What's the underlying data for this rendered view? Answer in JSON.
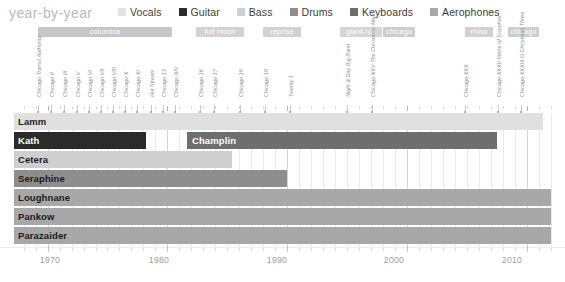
{
  "header": {
    "title": "year-by-year",
    "legend": [
      {
        "label": "Vocals",
        "color": "#e3e3e3",
        "key": "vocals"
      },
      {
        "label": "Guitar",
        "color": "#2b2b2b",
        "key": "guitar"
      },
      {
        "label": "Bass",
        "color": "#d0d0d0",
        "key": "bass"
      },
      {
        "label": "Drums",
        "color": "#8e8e8e",
        "key": "drums"
      },
      {
        "label": "Keyboards",
        "color": "#6e6e6e",
        "key": "keyboards"
      },
      {
        "label": "Aerophones",
        "color": "#a8a8a8",
        "key": "aerophones"
      }
    ]
  },
  "labels": [
    {
      "name": "columbia",
      "start_x": 38,
      "width": 134,
      "color": "#c6c6c6"
    },
    {
      "name": "full moon",
      "start_x": 196,
      "width": 48,
      "color": "#d2d2d2"
    },
    {
      "name": "reprise",
      "start_x": 263,
      "width": 38,
      "color": "#d2d2d2"
    },
    {
      "name": "giant-rca",
      "start_x": 340,
      "width": 42,
      "color": "#d6d6d6"
    },
    {
      "name": "chicago",
      "start_x": 383,
      "width": 32,
      "color": "#cdcdcd"
    },
    {
      "name": "rhino",
      "start_x": 465,
      "width": 28,
      "color": "#d2d2d2"
    },
    {
      "name": "chicago",
      "start_x": 508,
      "width": 31,
      "color": "#cdcdcd"
    }
  ],
  "albums": [
    {
      "title": "Chicago Transit Authority",
      "x": 38
    },
    {
      "title": "Chicago II",
      "x": 51
    },
    {
      "title": "Chicago III",
      "x": 64
    },
    {
      "title": "Chicago V",
      "x": 77
    },
    {
      "title": "Chicago VI",
      "x": 89
    },
    {
      "title": "Chicago VII",
      "x": 101
    },
    {
      "title": "Chicago VIII",
      "x": 113
    },
    {
      "title": "Chicago X",
      "x": 125
    },
    {
      "title": "Chicago XI",
      "x": 137
    },
    {
      "title": "Hot Streets",
      "x": 151
    },
    {
      "title": "Chicago 13",
      "x": 163
    },
    {
      "title": "Chicago XIV",
      "x": 175
    },
    {
      "title": "Chicago 16",
      "x": 200
    },
    {
      "title": "Chicago 17",
      "x": 214
    },
    {
      "title": "Chicago 18",
      "x": 240
    },
    {
      "title": "Chicago 19",
      "x": 265
    },
    {
      "title": "Twenty 1",
      "x": 290
    },
    {
      "title": "Night & Day Big Band",
      "x": 347
    },
    {
      "title": "Chicago XXV The Christmas Album",
      "x": 372
    },
    {
      "title": "Chicago XXX",
      "x": 465
    },
    {
      "title": "Chicago XXXII Stone of Sisyphus",
      "x": 498
    },
    {
      "title": "Chicago XXXIII O Christmas Three",
      "x": 521
    }
  ],
  "chart_data": {
    "type": "bar",
    "title": "year-by-year",
    "xlabel": "",
    "ylabel": "",
    "xlim": [
      1967,
      2012
    ],
    "grid": true,
    "legend_position": "top-right",
    "tick_years": [
      1970,
      1980,
      1990,
      2000,
      2010
    ],
    "members": [
      {
        "name": "Lamm",
        "role": "Keyboards",
        "color": "#e0e0e0",
        "start_year": 1967,
        "end_year": 2012,
        "label_on_dark": false
      },
      {
        "name": "Kath",
        "role": "Guitar",
        "color": "#2b2b2b",
        "start_year": 1967,
        "end_year": 1978,
        "label_on_dark": true
      },
      {
        "name": "Champlin",
        "role": "Keyboards",
        "color": "#6e6e6e",
        "start_year": 1981,
        "end_year": 2008,
        "label_on_dark": true
      },
      {
        "name": "Cetera",
        "role": "Bass",
        "color": "#cfcfcf",
        "start_year": 1967,
        "end_year": 1985,
        "label_on_dark": false
      },
      {
        "name": "Seraphine",
        "role": "Drums",
        "color": "#8e8e8e",
        "start_year": 1967,
        "end_year": 1990,
        "label_on_dark": false
      },
      {
        "name": "Loughnane",
        "role": "Aerophones",
        "color": "#a8a8a8",
        "start_year": 1967,
        "end_year": 2012,
        "label_on_dark": false
      },
      {
        "name": "Pankow",
        "role": "Aerophones",
        "color": "#a8a8a8",
        "start_year": 1967,
        "end_year": 2012,
        "label_on_dark": false
      },
      {
        "name": "Parazaider",
        "role": "Aerophones",
        "color": "#a8a8a8",
        "start_year": 1967,
        "end_year": 2012,
        "label_on_dark": false
      }
    ],
    "rows": [
      {
        "name": "Lamm",
        "bars": [
          {
            "x": 14,
            "w": 529,
            "color": "#e0e0e0"
          }
        ],
        "label_x": 18,
        "label_dark": false
      },
      {
        "name": "Kath",
        "bars": [
          {
            "x": 14,
            "w": 132,
            "color": "#2b2b2b"
          },
          {
            "x": 187,
            "w": 310,
            "color": "#6e6e6e"
          }
        ],
        "label_x": 18,
        "label_dark": true,
        "second_label": "Champlin",
        "second_label_x": 192
      },
      {
        "name": "Cetera",
        "bars": [
          {
            "x": 14,
            "w": 218,
            "color": "#cfcfcf"
          }
        ],
        "label_x": 18,
        "label_dark": false
      },
      {
        "name": "Seraphine",
        "bars": [
          {
            "x": 14,
            "w": 273,
            "color": "#8e8e8e"
          }
        ],
        "label_x": 18,
        "label_dark": false
      },
      {
        "name": "Loughnane",
        "bars": [
          {
            "x": 14,
            "w": 537,
            "color": "#a8a8a8"
          }
        ],
        "label_x": 18,
        "label_dark": false
      },
      {
        "name": "Pankow",
        "bars": [
          {
            "x": 14,
            "w": 537,
            "color": "#a8a8a8"
          }
        ],
        "label_x": 18,
        "label_dark": false
      },
      {
        "name": "Parazaider",
        "bars": [
          {
            "x": 14,
            "w": 537,
            "color": "#a8a8a8"
          }
        ],
        "label_x": 18,
        "label_dark": false
      }
    ]
  },
  "axis": {
    "tick_labels": [
      {
        "year": "1970",
        "x": 50
      },
      {
        "year": "1980",
        "x": 159
      },
      {
        "year": "1990",
        "x": 277
      },
      {
        "year": "2000",
        "x": 394
      },
      {
        "year": "2010",
        "x": 512
      }
    ]
  }
}
